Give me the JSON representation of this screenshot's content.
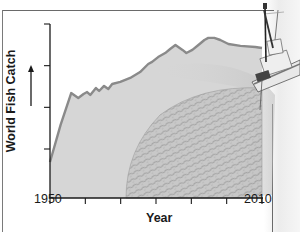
{
  "chart_data": {
    "type": "area",
    "title": "",
    "xlabel": "Year",
    "ylabel": "World Fish Catch",
    "ylabel_arrow": "up",
    "x_tick_labels": [
      "1950",
      "2010"
    ],
    "x_ticks": [
      1950,
      1960,
      1970,
      1980,
      1990,
      2000,
      2010
    ],
    "y_ticks_count": 4,
    "y_tick_labels": [],
    "y_units": "relative (0 = axis baseline, 100 = top tick)",
    "xlim": [
      1950,
      2010
    ],
    "ylim": [
      0,
      100
    ],
    "grid": false,
    "legend": null,
    "illustration": "fishing trawler hauling net whose catch forms the area under the curve",
    "series": [
      {
        "name": "World Fish Catch",
        "x": [
          1950,
          1953,
          1956,
          1958,
          1959.5,
          1960.5,
          1961.4,
          1963,
          1963.9,
          1965.3,
          1966.5,
          1967.6,
          1969.9,
          1972.7,
          1975.5,
          1977.8,
          1978.9,
          1980.6,
          1982.6,
          1984,
          1985.5,
          1987.5,
          1988.6,
          1990.3,
          1992,
          1993.7,
          1994.8,
          1996.5,
          1998.2,
          2000.5,
          2003.9,
          2008.1,
          2010
        ],
        "values": [
          20.7,
          42,
          60.3,
          57.5,
          59.8,
          60.9,
          59.2,
          63.2,
          61.5,
          64.4,
          62.6,
          65.5,
          66.7,
          69,
          72.4,
          77,
          78.2,
          81,
          83.3,
          85.6,
          87.9,
          85.1,
          83.3,
          85.1,
          87.9,
          90.8,
          92,
          92,
          90.8,
          88.5,
          87.4,
          86.8,
          86.2
        ]
      }
    ]
  },
  "labels": {
    "y_axis": "World Fish Catch",
    "x_axis": "Year",
    "x_start": "1950",
    "x_end": "2010"
  },
  "colors": {
    "area_fill": "#d6d6d6",
    "line": "#8a8a8a",
    "axis": "#1a1a1a",
    "background": "#ffffff"
  }
}
